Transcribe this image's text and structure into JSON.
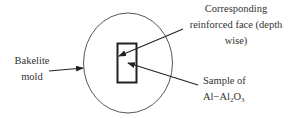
{
  "diagram": {
    "title": "",
    "colors": {
      "background": "#ffffff",
      "stroke": "#222222",
      "text": "#333333"
    },
    "mold": {
      "shape": "circle",
      "cx": 128,
      "cy": 63,
      "rx": 44.5,
      "ry": 50
    },
    "sample": {
      "shape": "rectangle",
      "x": 117,
      "y": 43,
      "width": 20,
      "height": 40
    },
    "labels": {
      "bakelite_line1": "Bakelite",
      "bakelite_line2": "mold",
      "face_line1": "Corresponding",
      "face_line2": "reinforced face (depth",
      "face_line3": "wise)",
      "sample_line1": "Sample of",
      "sample_line2_prefix": "Al−Al",
      "sample_line2_sub1": "2",
      "sample_line2_mid": "O",
      "sample_line2_sub2": "3"
    },
    "arrows": [
      {
        "name": "bakelite-mold-arrow",
        "from": [
          49,
          71
        ],
        "to": [
          83,
          68
        ]
      },
      {
        "name": "reinforced-face-arrow",
        "from": [
          183,
          29
        ],
        "to": [
          119,
          56
        ]
      },
      {
        "name": "sample-arrow",
        "from": [
          198,
          85
        ],
        "to": [
          128,
          63
        ]
      }
    ]
  }
}
